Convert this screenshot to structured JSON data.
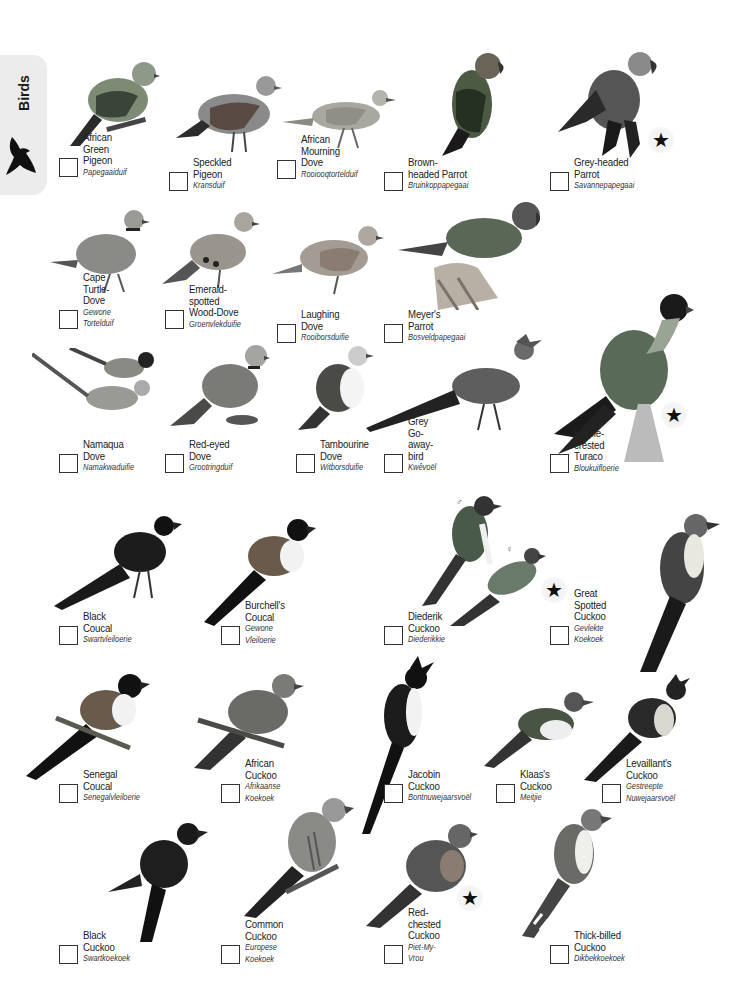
{
  "side_tab": {
    "label": "Birds",
    "icon": "flying-bird-silhouette-icon"
  },
  "birds": [
    {
      "common": "African\nGreen Pigeon",
      "afrikaans": "Papegaaiduif",
      "star": false
    },
    {
      "common": "Speckled Pigeon",
      "afrikaans": "Kransduif",
      "star": false
    },
    {
      "common": "African\nMourning Dove",
      "afrikaans": "Rooiooqtortelduif",
      "star": false
    },
    {
      "common": "Brown-headed Parrot",
      "afrikaans": "Bruinkoppapegaai",
      "star": false
    },
    {
      "common": "Grey-headed Parrot",
      "afrikaans": "Savannepapegaai",
      "star": true
    },
    {
      "common": "Cape Turtle-Dove",
      "afrikaans": "Gewone Tortelduif",
      "star": false
    },
    {
      "common": "Emerald-spotted\nWood-Dove",
      "afrikaans": "Groenvlekduifie",
      "star": false
    },
    {
      "common": "Laughing Dove",
      "afrikaans": "Rooiborsduifie",
      "star": false
    },
    {
      "common": "Meyer's Parrot",
      "afrikaans": "Bosveldpapegaai",
      "star": false
    },
    {
      "common": "Namaqua Dove",
      "afrikaans": "Namakwaduifie",
      "star": false
    },
    {
      "common": "Red-eyed Dove",
      "afrikaans": "Grootringduif",
      "star": false
    },
    {
      "common": "Tambourine Dove",
      "afrikaans": "Witborsduifie",
      "star": false
    },
    {
      "common": "Grey Go-away-bird",
      "afrikaans": "Kwêvoël",
      "star": false
    },
    {
      "common": "Purple-crested Turaco",
      "afrikaans": "Bloukuifloerie",
      "star": true
    },
    {
      "common": "Black Coucal",
      "afrikaans": "Swartvleiloerie",
      "star": false
    },
    {
      "common": "Burchell's Coucal",
      "afrikaans": "Gewone Vleiloerie",
      "star": false
    },
    {
      "common": "Diederik Cuckoo",
      "afrikaans": "Diederikkie",
      "star": true,
      "gender_marks": [
        "♂",
        "♀"
      ]
    },
    {
      "common": "Great\nSpotted Cuckoo",
      "afrikaans": "Gevlekte Koekoek",
      "star": false
    },
    {
      "common": "Senegal Coucal",
      "afrikaans": "Senegalvleiloerie",
      "star": false
    },
    {
      "common": "African Cuckoo",
      "afrikaans": "Afrikaanse Koekoek",
      "star": false
    },
    {
      "common": "Jacobin Cuckoo",
      "afrikaans": "Bontnuwejaarsvoël",
      "star": false
    },
    {
      "common": "Klaas's Cuckoo",
      "afrikaans": "Meitjie",
      "star": false
    },
    {
      "common": "Levaillant's Cuckoo",
      "afrikaans": "Gestreepte\nNuwejaarsvoël",
      "star": false
    },
    {
      "common": "Black\nCuckoo",
      "afrikaans": "Swartkoekoek",
      "star": false
    },
    {
      "common": "Common Cuckoo",
      "afrikaans": "Europese Koekoek",
      "star": false
    },
    {
      "common": "Red-chested Cuckoo",
      "afrikaans": "Piet-My-Vrou",
      "star": true
    },
    {
      "common": "Thick-billed Cuckoo",
      "afrikaans": "Dikbekkoekoek",
      "star": false
    }
  ],
  "star_symbol": "★"
}
